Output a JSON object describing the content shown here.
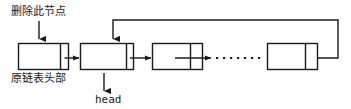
{
  "diagram": {
    "stroke_color": "#1a1a1a",
    "background_color": "#ffffff",
    "labels": {
      "delete_node": "删除此节点",
      "original_head": "原链表头部",
      "head_pointer": "head"
    },
    "nodes": [
      {
        "id": "node-1",
        "x": 18,
        "y": 43,
        "width": 50,
        "height": 26,
        "divider_x": 60
      },
      {
        "id": "node-2",
        "x": 80,
        "y": 43,
        "width": 53,
        "height": 26,
        "divider_x": 126
      },
      {
        "id": "node-3",
        "x": 152,
        "y": 43,
        "width": 50,
        "height": 26,
        "divider_x": 190
      },
      {
        "id": "node-last",
        "x": 267,
        "y": 43,
        "width": 50,
        "height": 26,
        "divider_x": 305
      }
    ],
    "connectors": [
      {
        "id": "arrow-node1-to-node2",
        "type": "solid-arrow",
        "from": "node-1",
        "to": "node-2"
      },
      {
        "id": "arrow-node2-to-node3",
        "type": "solid-arrow",
        "from": "node-2",
        "to": "node-3"
      },
      {
        "id": "arrow-node3-to-ellipsis",
        "type": "solid-arrow",
        "from": "node-3",
        "to": "ellipsis"
      },
      {
        "id": "ellipsis-dots",
        "type": "dotted",
        "dots": 6
      },
      {
        "id": "loop-last-to-node2",
        "type": "feedback-loop",
        "from": "node-last",
        "to": "node-2"
      },
      {
        "id": "arrow-delete-label-to-node1",
        "type": "pointer-arrow",
        "from": "delete_node",
        "to": "node-1"
      },
      {
        "id": "arrow-head-to-node2",
        "type": "pointer-arrow",
        "from": "head_pointer",
        "to": "node-2"
      }
    ]
  }
}
